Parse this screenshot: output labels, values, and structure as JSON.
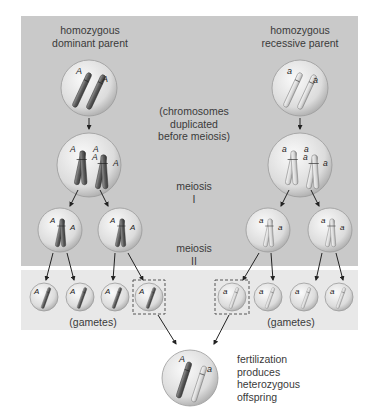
{
  "labels": {
    "dominant_parent": "homozygous\ndominant parent",
    "dominant_parent_line1": "homozygous",
    "dominant_parent_line2": "dominant parent",
    "recessive_parent_line1": "homozygous",
    "recessive_parent_line2": "recessive parent",
    "duplication_line1": "(chromosomes",
    "duplication_line2": "duplicated",
    "duplication_line3": "before meiosis)",
    "meiosis1_line1": "meiosis",
    "meiosis1_line2": "I",
    "meiosis2_line1": "meiosis",
    "meiosis2_line2": "II",
    "gametes_left": "(gametes)",
    "gametes_right": "(gametes)",
    "fertilization_line1": "fertilization",
    "fertilization_line2": "produces",
    "fertilization_line3": "heterozygous",
    "fertilization_line4": "offspring"
  },
  "alleles": {
    "dominant": "A",
    "recessive": "a"
  },
  "colors": {
    "panel": "#c9c9c9",
    "gamete_band": "#e8e8e8",
    "dominant_chromosome": "#6e6e6e",
    "recessive_chromosome": "#e0e0e0",
    "cell_fill": "#e4e4e4"
  },
  "stages": [
    {
      "name": "parents",
      "left": "AA",
      "right": "aa"
    },
    {
      "name": "duplicated",
      "left": "AA AA",
      "right": "aa aa"
    },
    {
      "name": "meiosis I",
      "left": [
        "AA",
        "AA"
      ],
      "right": [
        "aa",
        "aa"
      ]
    },
    {
      "name": "meiosis II gametes",
      "left": [
        "A",
        "A",
        "A",
        "A"
      ],
      "right": [
        "a",
        "a",
        "a",
        "a"
      ]
    },
    {
      "name": "offspring",
      "genotype": "Aa"
    }
  ]
}
